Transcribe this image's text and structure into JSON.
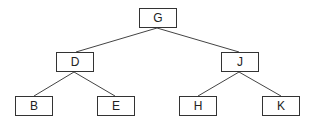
{
  "tree": {
    "nodes": [
      {
        "id": "G",
        "label": "G",
        "x": 139,
        "y": 8
      },
      {
        "id": "D",
        "label": "D",
        "x": 56,
        "y": 52
      },
      {
        "id": "J",
        "label": "J",
        "x": 221,
        "y": 52
      },
      {
        "id": "B",
        "label": "B",
        "x": 15,
        "y": 96
      },
      {
        "id": "E",
        "label": "E",
        "x": 97,
        "y": 96
      },
      {
        "id": "H",
        "label": "H",
        "x": 179,
        "y": 96
      },
      {
        "id": "K",
        "label": "K",
        "x": 262,
        "y": 96
      }
    ],
    "edges": [
      {
        "from": "G",
        "to": "D"
      },
      {
        "from": "G",
        "to": "J"
      },
      {
        "from": "D",
        "to": "B"
      },
      {
        "from": "D",
        "to": "E"
      },
      {
        "from": "J",
        "to": "H"
      },
      {
        "from": "J",
        "to": "K"
      }
    ]
  }
}
